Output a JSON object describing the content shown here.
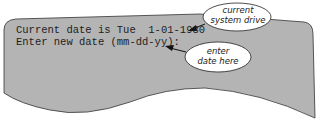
{
  "terminal": {
    "line1": "Current date is Tue  1-01-1980",
    "line2": "Enter new date (mm-dd-yy):"
  },
  "callouts": [
    {
      "line1": "current",
      "line2": "system drive"
    },
    {
      "line1": "enter",
      "line2": "date here"
    }
  ],
  "colors": {
    "screen": "#b4b4b4",
    "outline": "#333333",
    "bubble": "#ffffff"
  }
}
